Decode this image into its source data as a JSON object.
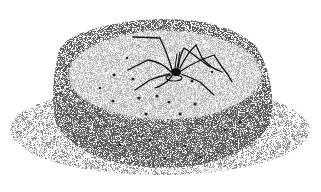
{
  "image": {
    "subject": "spider on a stippled sand mound",
    "style": "black-and-white stipple illustration",
    "background_color": "#ffffff",
    "ink_color": "#1a1a1a",
    "elements": [
      {
        "name": "mound",
        "description": "cylindrical stippled sand mound with flat top"
      },
      {
        "name": "spider",
        "description": "long-legged spider sitting at burrow hole in center of mound top"
      },
      {
        "name": "burrow-hole",
        "description": "small hole beneath spider"
      },
      {
        "name": "holes",
        "description": "small dots scattered on top and sides of mound"
      }
    ]
  }
}
